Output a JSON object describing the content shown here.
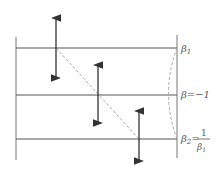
{
  "diagram": {
    "labels": {
      "beta1": {
        "base": "β",
        "sub": "1"
      },
      "beta_mid": {
        "text": "β=−1"
      },
      "beta2": {
        "base": "β",
        "sub": "2",
        "eq": "=",
        "num": "1",
        "den_base": "β",
        "den_sub": "1"
      }
    },
    "colors": {
      "line": "#555555",
      "dashed": "#aaaaaa",
      "arrow": "#333333"
    }
  }
}
